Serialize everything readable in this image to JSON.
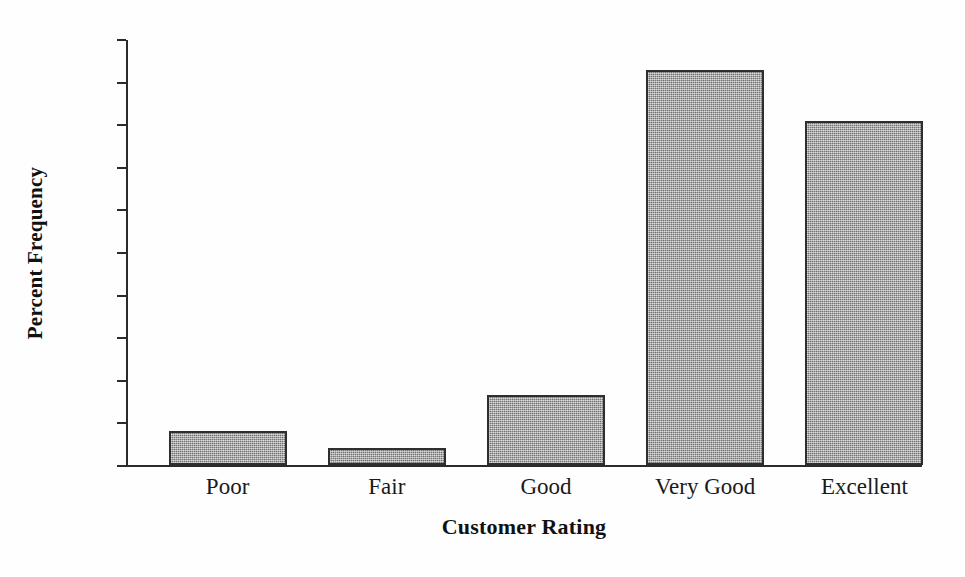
{
  "chart_data": {
    "type": "bar",
    "title": "",
    "subtitle": "",
    "xlabel": "Customer Rating",
    "ylabel": "Percent Frequency",
    "categories": [
      "Poor",
      "Fair",
      "Good",
      "Very Good",
      "Excellent"
    ],
    "values": [
      4.0,
      2.0,
      8.2,
      46.4,
      40.4
    ],
    "ylim": [
      0,
      50
    ],
    "ytick_step": 5,
    "yticks": [
      0,
      5,
      10,
      15,
      20,
      25,
      30,
      35,
      40,
      45,
      50
    ],
    "ytick_labels": [
      "0",
      "5",
      "10",
      "15",
      "20",
      "25",
      "30",
      "35",
      "40",
      "45",
      "50"
    ],
    "grid": false,
    "legend": false,
    "legend_position": "none",
    "annotations": [],
    "bar_fill_color": "#9c9c9c",
    "bar_border_color": "#2e2e2e",
    "axis_color": "#2b2b2b",
    "background_color": "#ffffff"
  },
  "axes": {
    "y_title": "Percent Frequency",
    "x_title": "Customer Rating"
  }
}
